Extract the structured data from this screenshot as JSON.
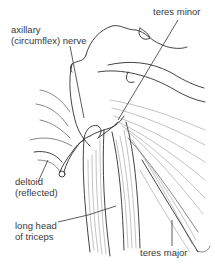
{
  "figure": {
    "ink_color": "#2e2e2e",
    "fiber_color": "#9a9a9a",
    "background": "#ffffff"
  },
  "labels": {
    "axillary_line1": "axillary",
    "axillary_line2": "(circumflex) nerve",
    "teres_minor": "teres minor",
    "deltoid_line1": "deltoid",
    "deltoid_line2": "(reflected)",
    "triceps_line1": "long head",
    "triceps_line2": "of triceps",
    "teres_major": "teres major"
  }
}
